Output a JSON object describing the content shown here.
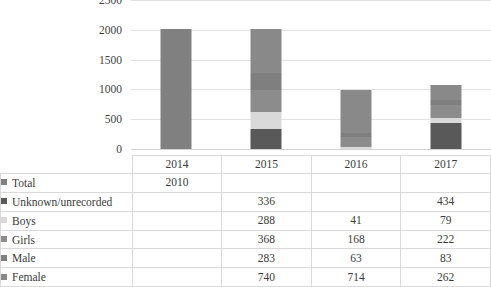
{
  "chart_data": {
    "type": "bar",
    "title": "",
    "subtitle": "",
    "xlabel": "",
    "ylabel": "",
    "stacked": true,
    "grid": true,
    "legend_position": "table-below",
    "ylim": [
      0,
      2500
    ],
    "ytick_step": 500,
    "ytick_labels": [
      "0",
      "500",
      "1000",
      "1500",
      "2000",
      "2500"
    ],
    "categories": [
      "2014",
      "2015",
      "2016",
      "2017"
    ],
    "series": [
      {
        "name": "Total",
        "color": "#808080",
        "values": [
          2010,
          null,
          null,
          null
        ],
        "display": [
          "2010",
          "",
          "",
          ""
        ]
      },
      {
        "name": "Unknown/unrecorded",
        "color": "#595959",
        "values": [
          null,
          336,
          null,
          434
        ],
        "display": [
          "",
          "336",
          "",
          "434"
        ]
      },
      {
        "name": "Boys",
        "color": "#d9d9d9",
        "values": [
          null,
          288,
          41,
          79
        ],
        "display": [
          "",
          "288",
          "41",
          "79"
        ]
      },
      {
        "name": "Girls",
        "color": "#8c8c8c",
        "values": [
          null,
          368,
          168,
          222
        ],
        "display": [
          "",
          "368",
          "168",
          "222"
        ]
      },
      {
        "name": "Male",
        "color": "#7f7f7f",
        "values": [
          null,
          283,
          63,
          83
        ],
        "display": [
          "",
          "283",
          "63",
          "83"
        ]
      },
      {
        "name": "Female",
        "color": "#898989",
        "values": [
          null,
          740,
          714,
          262
        ],
        "display": [
          "",
          "740",
          "714",
          "262"
        ]
      }
    ],
    "column_totals": [
      2010,
      2015,
      986,
      1080
    ]
  },
  "table": {
    "header_row": [
      "",
      "2014",
      "2015",
      "2016",
      "2017"
    ],
    "rows": [
      {
        "label": "Total",
        "marker": "legend-swatch-total",
        "values": [
          "2010",
          "",
          "",
          ""
        ]
      },
      {
        "label": "Unknown/unrecorded",
        "marker": "legend-swatch-unknown-unrecorded",
        "values": [
          "",
          "336",
          "",
          "434"
        ]
      },
      {
        "label": "Boys",
        "marker": "legend-swatch-boys",
        "values": [
          "",
          "288",
          "41",
          "79"
        ]
      },
      {
        "label": "Girls",
        "marker": "legend-swatch-girls",
        "values": [
          "",
          "368",
          "168",
          "222"
        ]
      },
      {
        "label": "Male",
        "marker": "legend-swatch-male",
        "values": [
          "",
          "283",
          "63",
          "83"
        ]
      },
      {
        "label": "Female",
        "marker": "legend-swatch-female",
        "values": [
          "",
          "740",
          "714",
          "262"
        ]
      }
    ]
  },
  "colors": {
    "gridline": "#e2e2e2",
    "baseline": "#d2d2d2",
    "table_border": "#d9d9d9",
    "text": "#3b3b3b",
    "background": "#ffffff"
  }
}
